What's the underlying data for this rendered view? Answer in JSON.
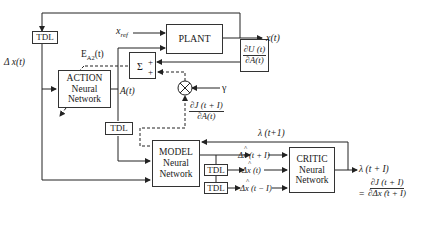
{
  "diagram": {
    "blocks": {
      "plant": "PLANT",
      "action": [
        "ACTION",
        "Neural",
        "Network"
      ],
      "model": [
        "MODEL",
        "Neural",
        "Network"
      ],
      "critic": [
        "CRITIC",
        "Neural",
        "Network"
      ],
      "tdl_top": "TDL",
      "tdl_mid": "TDL",
      "tdl_critic_1": "TDL",
      "tdl_critic_2": "TDL",
      "sum": "Σ",
      "sum_plus_1": "+",
      "sum_plus_2": "+",
      "dU_dA": {
        "num": "∂U (t)",
        "den": "∂A(t)"
      }
    },
    "labels": {
      "x_ref": "x",
      "x_ref_sub": "ref",
      "x_t": "x(t)",
      "delta_x_t": "Δ x(t)",
      "error": "E",
      "error_sub": "A2",
      "error_suffix": "(t)",
      "a_t": "A(t)",
      "gamma": "γ",
      "dJ_dA": {
        "num": "∂J (t + I)",
        "den": "∂A(t)"
      },
      "lambda_top": "λ (t+1)",
      "dx_hat_next": "Δx (t + I)",
      "dx_hat_now": "Δx (t)",
      "dx_hat_prev": "Δx (t − I)",
      "lambda_out": "λ (t + I)",
      "equals": "=",
      "critic_frac": {
        "num": "∂J (t + I)",
        "den": "∂Δx (t + I)"
      }
    }
  }
}
